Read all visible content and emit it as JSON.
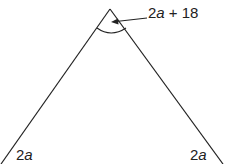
{
  "diagram": {
    "type": "triangle",
    "apex_angle_label": {
      "prefix": "2",
      "var": "a",
      "suffix": " + 18"
    },
    "bottom_left_angle_label": {
      "prefix": "2",
      "var": "a"
    },
    "bottom_right_angle_label": {
      "prefix": "2",
      "var": "a"
    },
    "line_color": "#222222"
  }
}
